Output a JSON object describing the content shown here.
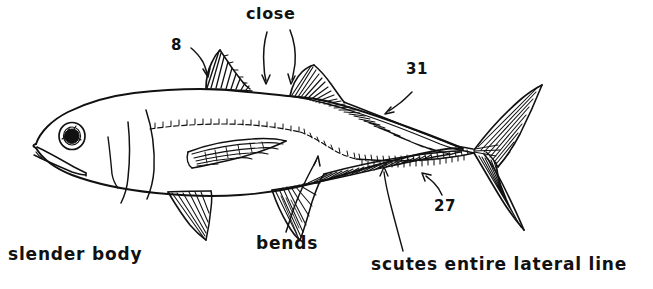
{
  "figure": {
    "kind": "fish-line-drawing",
    "background_color": "#ffffff",
    "ink_color": "#111111"
  },
  "annotations": {
    "close": "close",
    "dorsal_spine_count": "8",
    "second_dorsal_ray_count": "31",
    "anal_ray_count": "27",
    "bends": "bends",
    "slender_body": "slender body",
    "scutes_lateral_line": "scutes  entire  lateral  line"
  },
  "callouts": [
    {
      "name": "close",
      "text": "close",
      "points_to": "gap between first and second dorsal fins",
      "arrows": 2
    },
    {
      "name": "dorsal-spines",
      "text": "8",
      "points_to": "first dorsal fin spines",
      "arrows": 1
    },
    {
      "name": "second-dorsal-rays",
      "text": "31",
      "points_to": "second dorsal fin rays",
      "arrows": 1
    },
    {
      "name": "anal-rays",
      "text": "27",
      "points_to": "anal fin rays",
      "arrows": 1
    },
    {
      "name": "bends",
      "text": "bends",
      "points_to": "bend in lateral line",
      "arrows": 1
    },
    {
      "name": "slender-body",
      "text": "slender body",
      "points_to": "body profile",
      "arrows": 0
    },
    {
      "name": "scutes",
      "text": "scutes  entire  lateral  line",
      "points_to": "scute row along lateral line",
      "arrows": 0
    }
  ]
}
